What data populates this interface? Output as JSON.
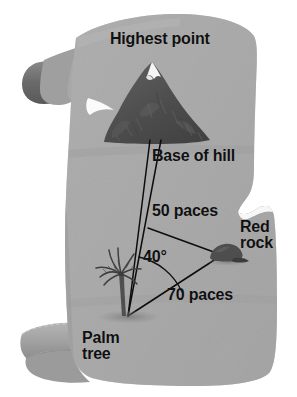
{
  "figure": {
    "type": "treasure-map-diagram",
    "medium": "aged parchment scroll",
    "title_label": "Highest point"
  },
  "labels": {
    "highest_point": "Highest point",
    "base_of_hill": "Base of hill",
    "distance_near": "50 paces",
    "distance_far": "70 paces",
    "angle": "40°",
    "red_rock": "Red\nrock",
    "palm_tree": "Palm\ntree"
  },
  "landmarks": [
    {
      "name": "hill",
      "label": "Base of hill",
      "icon": "mountain-icon",
      "has_snow_cap": true
    },
    {
      "name": "palm-tree",
      "label": "Palm tree",
      "icon": "palm-tree-icon"
    },
    {
      "name": "red-rock",
      "label": "Red rock",
      "icon": "rock-icon"
    },
    {
      "name": "summit",
      "label": "Highest point",
      "icon": "peak-icon"
    }
  ],
  "measurements": [
    {
      "from": "Palm tree",
      "to": "Base of hill",
      "value": "50 paces",
      "number": 50,
      "unit": "paces"
    },
    {
      "from": "Palm tree",
      "to": "Red rock",
      "value": "70 paces",
      "number": 70,
      "unit": "paces"
    },
    {
      "vertex": "Palm tree",
      "between": [
        "Base of hill",
        "Red rock"
      ],
      "value": "40°",
      "number": 40,
      "unit": "degrees"
    }
  ],
  "colors": {
    "parchment": "#a9a9a9",
    "parchment_shade": "#9a9a9a",
    "parchment_light": "#b5b5b5",
    "scroll_roll_dark": "#6e6e6e",
    "hill_dark": "#4a4a4a",
    "hill_mid": "#5c5c5c",
    "snow": "#f2f2f2",
    "ink": "#101010",
    "background": "#ffffff"
  }
}
